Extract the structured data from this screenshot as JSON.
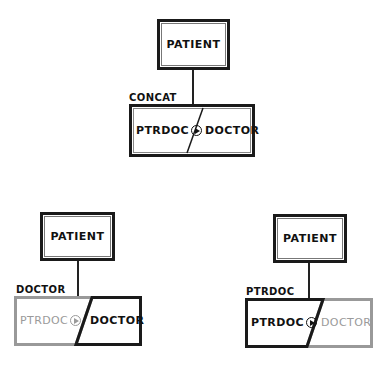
{
  "diagrams": [
    {
      "id": "top",
      "parent": "PATIENT",
      "relation_label": "CONCAT",
      "left_part": "PTRDOC",
      "right_part": "DOCTOR",
      "highlight": "both"
    },
    {
      "id": "bottom-left",
      "parent": "PATIENT",
      "relation_label": "DOCTOR",
      "left_part": "PTRDOC",
      "right_part": "DOCTOR",
      "highlight": "right"
    },
    {
      "id": "bottom-right",
      "parent": "PATIENT",
      "relation_label": "PTRDOC",
      "left_part": "PTRDOC",
      "right_part": "DOCTOR",
      "highlight": "left"
    }
  ],
  "colors": {
    "strong": "#1a1a1a",
    "dim": "#9a9a9a"
  }
}
